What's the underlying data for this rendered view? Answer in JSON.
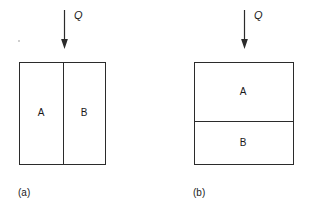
{
  "figure": {
    "background_color": "#ffffff",
    "line_color": "#2b2b2b",
    "text_color": "#1a1a1a"
  },
  "panels": [
    {
      "id": "a",
      "caption": "(a)",
      "flux": {
        "label": "Q",
        "icon": "down-arrow-icon",
        "direction": "down"
      },
      "arrangement": "series-vertical-interface",
      "regions": [
        {
          "id": "A",
          "label": "A"
        },
        {
          "id": "B",
          "label": "B"
        }
      ]
    },
    {
      "id": "b",
      "caption": "(b)",
      "flux": {
        "label": "Q",
        "icon": "down-arrow-icon",
        "direction": "down"
      },
      "arrangement": "series-horizontal-interface",
      "regions": [
        {
          "id": "A",
          "label": "A"
        },
        {
          "id": "B",
          "label": "B"
        }
      ]
    }
  ]
}
